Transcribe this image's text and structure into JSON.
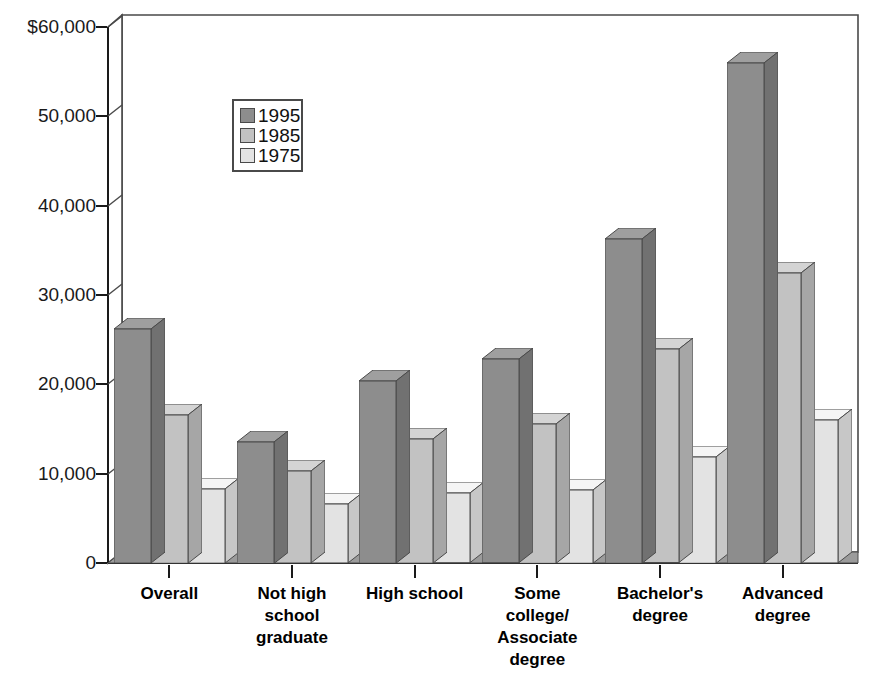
{
  "chart_data": {
    "type": "bar",
    "title": "",
    "subtitle": "",
    "xlabel": "",
    "ylabel": "",
    "grid": false,
    "legend_position": "top-left-inside",
    "y_axis": {
      "min": 0,
      "max": 60000,
      "tick_values": [
        0,
        10000,
        20000,
        30000,
        40000,
        50000,
        60000
      ],
      "tick_labels": [
        "0",
        "10,000",
        "20,000",
        "30,000",
        "40,000",
        "50,000",
        "$60,000"
      ]
    },
    "categories": [
      "Overall",
      "Not high\nschool\ngraduate",
      "High school",
      "Some\ncollege/\nAssociate\ndegree",
      "Bachelor's\ndegree",
      "Advanced\ndegree"
    ],
    "series": [
      {
        "name": "1995",
        "color": "#8d8d8d",
        "values": [
          26200,
          13600,
          20400,
          22800,
          36300,
          56000
        ]
      },
      {
        "name": "1985",
        "color": "#c2c2c2",
        "values": [
          16600,
          10300,
          13900,
          15600,
          23900,
          32500
        ]
      },
      {
        "name": "1975",
        "color": "#e3e3e3",
        "values": [
          8300,
          6600,
          7800,
          8200,
          11900,
          16000
        ]
      }
    ]
  },
  "legend": {
    "entries": [
      {
        "label": "1995"
      },
      {
        "label": "1985"
      },
      {
        "label": "1975"
      }
    ]
  },
  "colors": {
    "series_1995": "#8d8d8d",
    "series_1985": "#c2c2c2",
    "series_1975": "#e3e3e3",
    "floor": "#9b9b9b",
    "outline": "#4a4a4a",
    "background": "#ffffff",
    "text": "#111111"
  }
}
